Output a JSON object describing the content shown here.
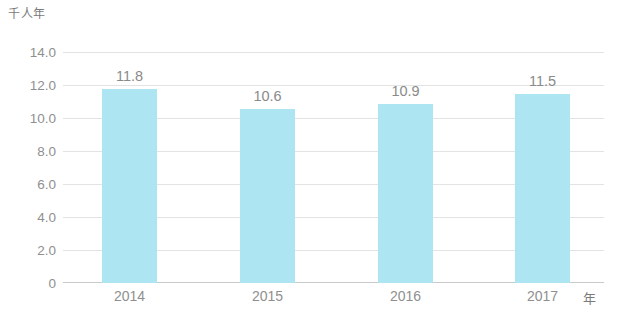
{
  "chart_data": {
    "type": "bar",
    "title": "",
    "subtitle": "",
    "categories": [
      "2014",
      "2015",
      "2016",
      "2017"
    ],
    "values": [
      11.8,
      10.6,
      10.9,
      11.5
    ],
    "value_labels": [
      "11.8",
      "10.6",
      "10.9",
      "11.5"
    ],
    "series": [
      {
        "name": "",
        "values": [
          11.8,
          10.6,
          10.9,
          11.5
        ],
        "color": "#ade5f2"
      }
    ],
    "xlabel": "年",
    "ylabel": "千人年",
    "ylim": [
      0,
      14
    ],
    "ytick_values": [
      14.0,
      12.0,
      10.0,
      8.0,
      6.0,
      4.0,
      2.0,
      0
    ],
    "ytick_labels": [
      "14.0",
      "12.0",
      "10.0",
      "8.0",
      "6.0",
      "4.0",
      "2.0",
      "0"
    ],
    "grid": true,
    "grid_axis": "y",
    "legend": false,
    "legend_position": "none",
    "bar_color": "#ade5f2",
    "gridline_color": "#e3e3e3",
    "baseline_color": "#c9c9c9",
    "text_color": "#8f8f8f",
    "background": "#ffffff"
  },
  "axes": {
    "y_unit": "千人年",
    "x_unit": "年"
  }
}
